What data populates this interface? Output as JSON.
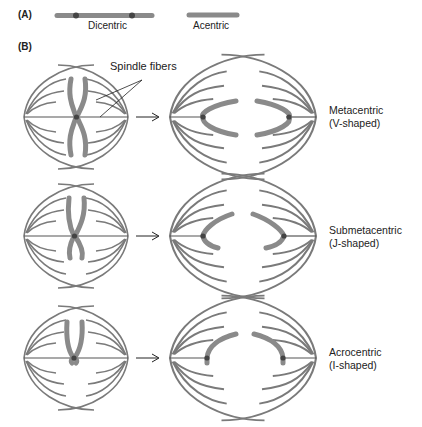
{
  "panel_a": {
    "label": "(A)",
    "items": [
      {
        "name": "Dicentric",
        "centromeres": 2
      },
      {
        "name": "Acentric",
        "centromeres": 0
      }
    ]
  },
  "panel_b": {
    "label": "(B)",
    "annotation": "Spindle fibers",
    "rows": [
      {
        "type": "Metacentric",
        "shape": "(V-shaped)"
      },
      {
        "type": "Submetacentric",
        "shape": "(J-shaped)"
      },
      {
        "type": "Acrocentric",
        "shape": "(I-shaped)"
      }
    ]
  },
  "colors": {
    "chromosome": "#8a8a8a",
    "fiber": "#7a7a7a",
    "centromere": "#3a3a3a",
    "text": "#222222"
  }
}
